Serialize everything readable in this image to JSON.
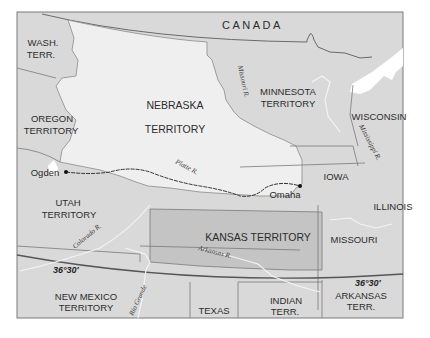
{
  "map": {
    "title": "Nebraska Territory and the Union Pacific route (Ogden–Omaha)",
    "colors": {
      "background": "#ffffff",
      "land": "#d9d9d9",
      "nebraska": "#efefef",
      "kansas": "#c4c4c4",
      "water": "#ffffff",
      "border": "#7a7a7a",
      "latitude_line": "#555555",
      "railroad": "#333333"
    },
    "regions": {
      "canada": "CANADA",
      "wash_line1": "WASH.",
      "wash_line2": "TERR.",
      "oregon_line1": "OREGON",
      "oregon_line2": "TERRITORY",
      "nebraska_line1": "NEBRASKA",
      "nebraska_line2": "TERRITORY",
      "minnesota_line1": "MINNESOTA",
      "minnesota_line2": "TERRITORY",
      "wisconsin": "WISCONSIN",
      "iowa": "IOWA",
      "illinois": "ILLINOIS",
      "utah_line1": "UTAH",
      "utah_line2": "TERRITORY",
      "kansas": "KANSAS TERRITORY",
      "missouri": "MISSOURI",
      "new_mexico_line1": "NEW MEXICO",
      "new_mexico_line2": "TERRITORY",
      "texas": "TEXAS",
      "indian_line1": "INDIAN",
      "indian_line2": "TERR.",
      "arkansas_line1": "ARKANSAS",
      "arkansas_line2": "TERR."
    },
    "rivers": {
      "missouri": "Missouri R.",
      "mississippi": "Mississippi R.",
      "platte": "Platte R.",
      "colorado": "Colorado R.",
      "arkansas": "Arkansas R.",
      "rio_grande": "Rio Grande"
    },
    "cities": {
      "west": "Ogden",
      "east": "Omaha"
    },
    "latitude": {
      "west_label": "36°30′",
      "east_label": "36°30′"
    }
  }
}
